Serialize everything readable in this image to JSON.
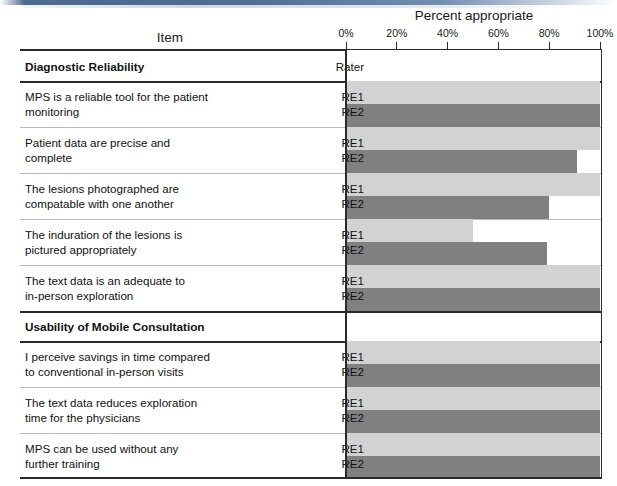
{
  "chart_data": {
    "type": "bar",
    "title": "Percent appropriate",
    "item_column_header": "Item",
    "rater_column_header": "Rater",
    "xlabel": "Percent appropriate",
    "ylabel": "",
    "xlim": [
      0,
      100
    ],
    "xticks": [
      0,
      20,
      40,
      60,
      80,
      100
    ],
    "xtick_labels": [
      "0%",
      "20%",
      "40%",
      "60%",
      "80%",
      "100%"
    ],
    "grid": false,
    "legend_position": "none",
    "orientation": "horizontal",
    "series": [
      {
        "name": "RE1",
        "color": "#d2d2d2"
      },
      {
        "name": "RE2",
        "color": "#808080"
      }
    ],
    "sections": [
      {
        "section_label": "Diagnostic Reliability",
        "items": [
          {
            "label_line1": "MPS is a reliable tool for the patient",
            "label_line2": "monitoring",
            "RE1": 100,
            "RE2": 100
          },
          {
            "label_line1": "Patient data are precise and",
            "label_line2": "complete",
            "RE1": 100,
            "RE2": 91
          },
          {
            "label_line1": "The lesions photographed are",
            "label_line2": "compatable with one another",
            "RE1": 100,
            "RE2": 80
          },
          {
            "label_line1": "The induration of the lesions is",
            "label_line2": "pictured appropriately",
            "RE1": 50,
            "RE2": 79
          },
          {
            "label_line1": "The text data is an adequate to",
            "label_line2": "in-person exploration",
            "RE1": 100,
            "RE2": 100
          }
        ]
      },
      {
        "section_label": "Usability of Mobile Consultation",
        "items": [
          {
            "label_line1": "I perceive savings in time compared",
            "label_line2": "to conventional in-person visits",
            "RE1": 100,
            "RE2": 100
          },
          {
            "label_line1": "The text data reduces exploration",
            "label_line2": "time for the physicians",
            "RE1": 100,
            "RE2": 100
          },
          {
            "label_line1": "MPS can be used without any",
            "label_line2": "further training",
            "RE1": 100,
            "RE2": 100
          }
        ]
      }
    ]
  },
  "header": {
    "axis_title": "Percent appropriate",
    "item_title": "Item"
  },
  "colors": {
    "re1": "#d2d2d2",
    "re2": "#808080",
    "rule": "#2a2a2a",
    "row_separator": "#b9b9b9"
  }
}
